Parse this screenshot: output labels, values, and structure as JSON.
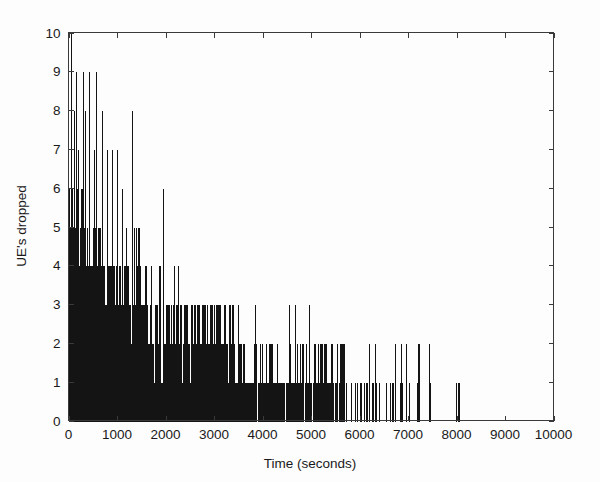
{
  "chart_data": {
    "type": "bar",
    "title": "",
    "subtitle": "",
    "xlabel": "Time (seconds)",
    "ylabel": "UE's dropped",
    "xlim": [
      0,
      10000
    ],
    "ylim": [
      0,
      10
    ],
    "xticks": [
      0,
      1000,
      2000,
      3000,
      4000,
      5000,
      6000,
      7000,
      8000,
      9000,
      10000
    ],
    "yticks": [
      0,
      1,
      2,
      3,
      4,
      5,
      6,
      7,
      8,
      9,
      10
    ],
    "xtick_labels": [
      "0",
      "1000",
      "2000",
      "3000",
      "4000",
      "5000",
      "6000",
      "7000",
      "8000",
      "9000",
      "10000"
    ],
    "ytick_labels": [
      "0",
      "1",
      "2",
      "3",
      "4",
      "5",
      "6",
      "7",
      "8",
      "9",
      "10"
    ],
    "grid": false,
    "legend": null,
    "legend_position": "none",
    "bar_color": "#141414",
    "axis_color": "#3a3a3a",
    "background_color": "#fdfdfd",
    "series_name": "UE's dropped",
    "sample_interval": 10,
    "envelope_description": "Maximum dropped UE count decays from 10 near t=0 to about 8-9 by t=1300, 6 by t=2000, 3 by t=3400, and 2 for most of t=3500-7500.",
    "notable_points": [
      {
        "x": 60,
        "y": 10
      },
      {
        "x": 150,
        "y": 9
      },
      {
        "x": 300,
        "y": 9
      },
      {
        "x": 430,
        "y": 9
      },
      {
        "x": 560,
        "y": 9
      },
      {
        "x": 110,
        "y": 8
      },
      {
        "x": 350,
        "y": 8
      },
      {
        "x": 700,
        "y": 8
      },
      {
        "x": 1300,
        "y": 8
      },
      {
        "x": 520,
        "y": 7
      },
      {
        "x": 800,
        "y": 7
      },
      {
        "x": 900,
        "y": 7
      },
      {
        "x": 1000,
        "y": 7
      },
      {
        "x": 1100,
        "y": 6
      },
      {
        "x": 1950,
        "y": 6
      },
      {
        "x": 1450,
        "y": 5
      },
      {
        "x": 1600,
        "y": 4
      },
      {
        "x": 1950,
        "y": 4
      },
      {
        "x": 2400,
        "y": 3
      },
      {
        "x": 2700,
        "y": 3
      },
      {
        "x": 3000,
        "y": 3
      },
      {
        "x": 3400,
        "y": 3
      },
      {
        "x": 4950,
        "y": 3
      },
      {
        "x": 5600,
        "y": 2
      },
      {
        "x": 6200,
        "y": 2
      },
      {
        "x": 6950,
        "y": 2
      },
      {
        "x": 7200,
        "y": 2
      },
      {
        "x": 7450,
        "y": 1
      },
      {
        "x": 8050,
        "y": 1
      }
    ],
    "max_value": 10,
    "min_value": 0,
    "x_of_max": 60,
    "last_nonzero_x": 8050
  }
}
